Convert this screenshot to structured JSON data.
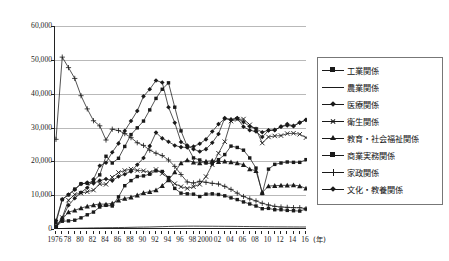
{
  "chart_data": {
    "type": "line",
    "title": "",
    "xlabel": "(年)",
    "ylabel": "",
    "ylim": [
      0,
      60000
    ],
    "xlim": [
      1976,
      2016
    ],
    "grid": true,
    "legend_position": "right",
    "y_ticks": [
      "0",
      "10,000",
      "20,000",
      "30,000",
      "40,000",
      "50,000",
      "60,000"
    ],
    "y_tick_values": [
      0,
      10000,
      20000,
      30000,
      40000,
      50000,
      60000
    ],
    "x_tick_labels": [
      "1976",
      "78",
      "80",
      "82",
      "84",
      "86",
      "88",
      "90",
      "92",
      "94",
      "96",
      "98",
      "2000",
      "02",
      "04",
      "06",
      "08",
      "10",
      "12",
      "14",
      "16"
    ],
    "x_tick_values": [
      1976,
      1978,
      1980,
      1982,
      1984,
      1986,
      1988,
      1990,
      1992,
      1994,
      1996,
      1998,
      2000,
      2002,
      2004,
      2006,
      2008,
      2010,
      2012,
      2014,
      2016
    ],
    "x": [
      1976,
      1977,
      1978,
      1979,
      1980,
      1981,
      1982,
      1983,
      1984,
      1985,
      1986,
      1987,
      1988,
      1989,
      1990,
      1991,
      1992,
      1993,
      1994,
      1995,
      1996,
      1997,
      1998,
      1999,
      2000,
      2001,
      2002,
      2003,
      2004,
      2005,
      2006,
      2007,
      2008,
      2009,
      2010,
      2011,
      2012,
      2013,
      2014,
      2015,
      2016
    ],
    "series": [
      {
        "name": "工業関係",
        "marker": "square",
        "values": [
          600,
          2300,
          2400,
          2600,
          3300,
          4200,
          5000,
          6500,
          7000,
          6800,
          9500,
          12800,
          14300,
          15500,
          15700,
          16200,
          17200,
          17000,
          15200,
          12000,
          10600,
          10400,
          10300,
          9600,
          10300,
          10400,
          10200,
          9800,
          9200,
          8700,
          8000,
          7400,
          6800,
          6000,
          6100,
          5700,
          5700,
          5500,
          5400,
          5300,
          5900
        ]
      },
      {
        "name": "農業関係",
        "marker": "none",
        "values": [
          100,
          150,
          200,
          230,
          260,
          290,
          320,
          350,
          380,
          400,
          430,
          460,
          500,
          540,
          570,
          600,
          650,
          700,
          750,
          800,
          820,
          840,
          850,
          840,
          830,
          820,
          800,
          790,
          780,
          760,
          740,
          720,
          700,
          680,
          660,
          640,
          630,
          620,
          610,
          600,
          600
        ]
      },
      {
        "name": "医療関係",
        "marker": "diamond",
        "values": [
          2500,
          8800,
          10200,
          11600,
          13300,
          13700,
          13500,
          14300,
          14800,
          14300,
          15500,
          16200,
          17000,
          19000,
          21000,
          24500,
          28500,
          26800,
          25800,
          24700,
          24200,
          24100,
          24400,
          25200,
          26500,
          28800,
          31000,
          32600,
          32400,
          32700,
          31600,
          30300,
          29600,
          28600,
          29200,
          29300,
          30200,
          31000,
          30500,
          31500,
          32200
        ]
      },
      {
        "name": "衛生関係",
        "marker": "x",
        "values": [
          800,
          3400,
          8500,
          10200,
          10600,
          11000,
          11500,
          13300,
          13200,
          15300,
          16700,
          17300,
          17700,
          17300,
          17200,
          16700,
          17600,
          16400,
          15000,
          13400,
          12500,
          12000,
          12500,
          13200,
          15500,
          19000,
          22400,
          25800,
          31900,
          32400,
          32500,
          30800,
          29500,
          25400,
          27200,
          27500,
          27600,
          28200,
          28300,
          28000,
          27000
        ]
      },
      {
        "name": "教育・社会福祉関係",
        "marker": "triangle",
        "values": [
          600,
          2900,
          5000,
          5500,
          6200,
          6700,
          7100,
          7400,
          7300,
          7600,
          8500,
          9000,
          9400,
          10000,
          10700,
          11000,
          11500,
          12800,
          14500,
          16800,
          19500,
          20400,
          19700,
          19500,
          20000,
          20200,
          19900,
          20000,
          19800,
          19500,
          19000,
          17700,
          17200,
          10800,
          12700,
          12800,
          12900,
          12900,
          13000,
          12700,
          12000
        ]
      },
      {
        "name": "商業実務関係",
        "marker": "square2",
        "values": [
          1800,
          8700,
          10100,
          11800,
          13400,
          13500,
          14200,
          16000,
          21500,
          19500,
          20900,
          24400,
          27900,
          29900,
          31900,
          35200,
          38600,
          41300,
          43200,
          36000,
          29000,
          24400,
          21000,
          20400,
          19500,
          19300,
          20500,
          22000,
          24500,
          24100,
          23300,
          21000,
          18000,
          10500,
          17700,
          19100,
          19500,
          19800,
          19700,
          19700,
          20500
        ]
      },
      {
        "name": "家政関係",
        "marker": "plus",
        "values": [
          26500,
          50800,
          47700,
          44500,
          39400,
          35500,
          32000,
          30500,
          26300,
          29500,
          29100,
          28200,
          27000,
          25500,
          24700,
          23300,
          22400,
          21700,
          20400,
          18500,
          16100,
          13900,
          13600,
          14100,
          13800,
          13500,
          13300,
          12600,
          11700,
          10600,
          9600,
          8900,
          8300,
          7600,
          7100,
          6700,
          6500,
          6400,
          6300,
          6300,
          6000
        ]
      },
      {
        "name": "文化・教養関係",
        "marker": "diamond2",
        "values": [
          700,
          3200,
          7000,
          9100,
          10800,
          12200,
          14700,
          18700,
          19600,
          22700,
          25300,
          29000,
          31900,
          34900,
          39200,
          41300,
          43900,
          43300,
          36000,
          31400,
          25700,
          24700,
          23600,
          22900,
          23600,
          25500,
          28100,
          32800,
          32200,
          32800,
          30200,
          29200,
          28800,
          27200,
          29100,
          29200,
          30300,
          30600,
          30400,
          31400,
          32300
        ]
      }
    ]
  },
  "legend": {
    "items": [
      {
        "label": "工業関係",
        "marker": "square"
      },
      {
        "label": "農業関係",
        "marker": "none"
      },
      {
        "label": "医療関係",
        "marker": "diamond"
      },
      {
        "label": "衛生関係",
        "marker": "x"
      },
      {
        "label": "教育・社会福祉関係",
        "marker": "triangle"
      },
      {
        "label": "商業実務関係",
        "marker": "square"
      },
      {
        "label": "家政関係",
        "marker": "plus"
      },
      {
        "label": "文化・教養関係",
        "marker": "diamond"
      }
    ]
  },
  "colors": {
    "line": "#1a1a1a",
    "grid": "#b9b9b9",
    "axis": "#222222",
    "text": "#111111",
    "legend_border": "#777777",
    "background": "#ffffff"
  }
}
